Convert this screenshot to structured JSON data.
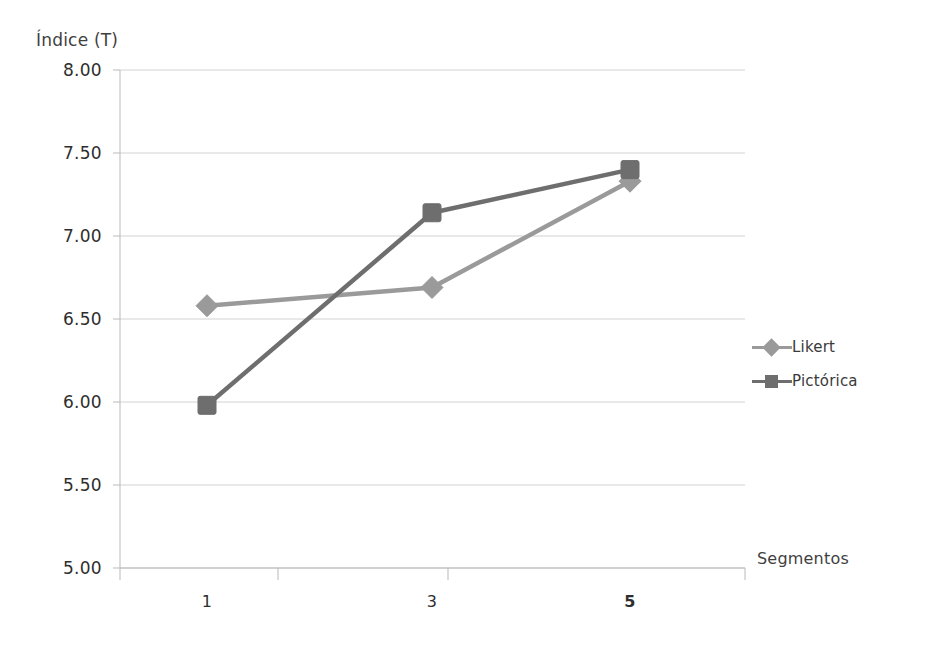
{
  "chart_data": {
    "type": "line",
    "title": "",
    "xlabel": "Segmentos",
    "ylabel": "Índice (T)",
    "categories": [
      "1",
      "3",
      "5"
    ],
    "ylim": [
      5.0,
      8.0
    ],
    "ytick_step": 0.5,
    "ytick_labels": [
      "8.00",
      "7.50",
      "7.00",
      "6.50",
      "6.00",
      "5.50",
      "5.00"
    ],
    "ytick_values": [
      8.0,
      7.5,
      7.0,
      6.5,
      6.0,
      5.5,
      5.0
    ],
    "grid": true,
    "legend_position": "right",
    "series": [
      {
        "name": "Likert",
        "marker": "diamond",
        "color": "#9a9a9a",
        "values": [
          6.58,
          6.69,
          7.33
        ]
      },
      {
        "name": "Pictórica",
        "marker": "square",
        "color": "#6e6e6e",
        "values": [
          5.98,
          7.14,
          7.4
        ]
      }
    ],
    "emphasized_xtick": "5"
  },
  "colors": {
    "likert": "#9a9a9a",
    "pictorica": "#6e6e6e",
    "gridline": "#d2d2d2",
    "axis": "#b9b9b9",
    "text": "#3a3a3a"
  }
}
